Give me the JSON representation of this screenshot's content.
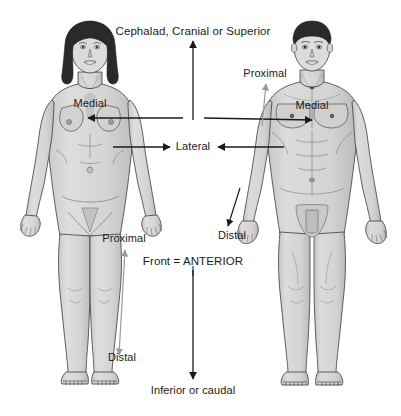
{
  "figure": {
    "background_color": "#ffffff",
    "skin_color": "#d9d9d9",
    "skin_shadow_color": "#b8b8b8",
    "outline_color": "#3c3c3c",
    "hair_color": "#2a2a2a",
    "arrow_color": "#1a1a1a",
    "faint_arrow_color": "#9a9a9a",
    "text_color": "#1a1a1a"
  },
  "labels": {
    "superior": "Cephalad, Cranial or Superior",
    "inferior": "Inferior or caudal",
    "anterior": "Front = ANTERIOR",
    "lateral": "Lateral",
    "medial_female": "Medial",
    "medial_male": "Medial",
    "proximal_female": "Proximal",
    "distal_female": "Distal",
    "proximal_male": "Proximal",
    "distal_male": "Distal"
  },
  "figures": [
    {
      "name": "female-figure",
      "sex": "female",
      "view": "anterior",
      "side": "left",
      "annotations": [
        "Medial",
        "Proximal",
        "Distal"
      ]
    },
    {
      "name": "male-figure",
      "sex": "male",
      "view": "anterior",
      "side": "right",
      "annotations": [
        "Proximal",
        "Medial",
        "Distal"
      ]
    }
  ],
  "arrows": [
    {
      "name": "superior-arrow",
      "direction": "up",
      "label": "Cephalad, Cranial or Superior",
      "style": "solid-dark"
    },
    {
      "name": "inferior-arrow",
      "direction": "down",
      "label": "Inferior or caudal",
      "style": "solid-dark"
    },
    {
      "name": "anterior-pointer",
      "direction": "down",
      "label": "Front = ANTERIOR",
      "style": "line"
    },
    {
      "name": "medial-arrow-female",
      "direction": "left",
      "label": "Medial",
      "style": "solid-dark"
    },
    {
      "name": "medial-arrow-male",
      "direction": "right",
      "label": "Medial",
      "style": "solid-dark"
    },
    {
      "name": "lateral-arrow-left",
      "direction": "right",
      "label": "Lateral",
      "style": "solid-dark"
    },
    {
      "name": "lateral-arrow-right",
      "direction": "left",
      "label": "Lateral",
      "style": "solid-dark"
    },
    {
      "name": "proximal-distal-arrow-female",
      "direction": "bidirectional-vertical",
      "label": "Proximal / Distal",
      "style": "faint"
    },
    {
      "name": "proximal-arrow-male",
      "direction": "up",
      "label": "Proximal",
      "style": "faint"
    },
    {
      "name": "distal-arrow-male",
      "direction": "down",
      "label": "Distal",
      "style": "solid-dark"
    }
  ]
}
